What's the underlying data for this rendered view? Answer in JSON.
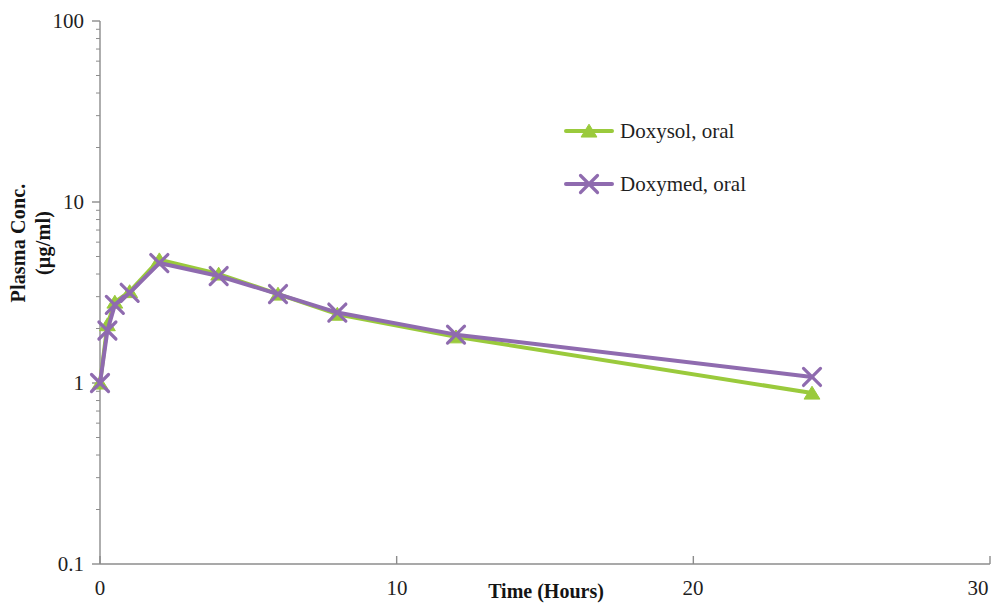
{
  "chart_data": {
    "type": "line",
    "title": "",
    "xlabel": "Time (Hours)",
    "ylabel_line1": "Plasma Conc.",
    "ylabel_line2": "(µg/ml)",
    "yscale": "log",
    "xlim": [
      0,
      30
    ],
    "ylim": [
      0.1,
      100
    ],
    "xticks": [
      0,
      10,
      20,
      30
    ],
    "xtick_labels": [
      "0",
      "10",
      "20",
      "30"
    ],
    "yticks": [
      0.1,
      1,
      10,
      100
    ],
    "ytick_labels": [
      "0.1",
      "1",
      "10",
      "100"
    ],
    "grid": false,
    "legend_position": "upper right inside",
    "series": [
      {
        "name": "Doxysol, oral",
        "color": "#9ACA3C",
        "marker": "triangle",
        "x": [
          0,
          0.25,
          0.5,
          1,
          2,
          4,
          6,
          8,
          12,
          24
        ],
        "values": [
          1.0,
          2.1,
          2.8,
          3.2,
          4.8,
          4.0,
          3.1,
          2.4,
          1.8,
          0.88
        ]
      },
      {
        "name": "Doxymed, oral",
        "color": "#8F6BAF",
        "marker": "x",
        "x": [
          0,
          0.25,
          0.5,
          1,
          2,
          4,
          6,
          8,
          12,
          24
        ],
        "values": [
          1.0,
          1.95,
          2.7,
          3.15,
          4.6,
          3.9,
          3.1,
          2.45,
          1.85,
          1.08
        ]
      }
    ]
  },
  "legend": {
    "entries": [
      {
        "label": "Doxysol, oral"
      },
      {
        "label": "Doxymed, oral"
      }
    ]
  },
  "axes": {
    "x_title": "Time (Hours)",
    "y_title_line1": "Plasma Conc.",
    "y_title_line2": "(µg/ml)"
  }
}
